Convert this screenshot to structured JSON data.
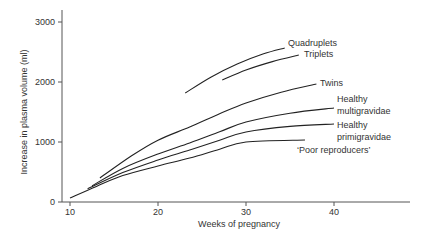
{
  "chart_data": {
    "type": "line",
    "title": "",
    "xlabel": "Weeks of pregnancy",
    "ylabel": "Increase in plasma volume (ml)",
    "xlim": [
      10,
      48.5
    ],
    "ylim": [
      0,
      3300
    ],
    "xticks": [
      10,
      20,
      30,
      40
    ],
    "yticks": [
      0,
      1000,
      2000,
      3000
    ],
    "grid": false,
    "legend": "inline labels at curve ends",
    "series": [
      {
        "name": "Quadruplets",
        "label_lines": [
          "Quadruplets"
        ],
        "points": [
          [
            23.1,
            1817
          ],
          [
            26,
            2080
          ],
          [
            29,
            2300
          ],
          [
            32,
            2470
          ],
          [
            34.4,
            2567
          ]
        ]
      },
      {
        "name": "Triplets",
        "label_lines": [
          "Triplets"
        ],
        "points": [
          [
            27.3,
            2033
          ],
          [
            30,
            2200
          ],
          [
            33,
            2340
          ],
          [
            36,
            2450
          ]
        ]
      },
      {
        "name": "Twins",
        "label_lines": [
          "Twins"
        ],
        "points": [
          [
            13.4,
            400
          ],
          [
            17,
            770
          ],
          [
            20,
            1030
          ],
          [
            23.6,
            1250
          ],
          [
            27,
            1470
          ],
          [
            30,
            1650
          ],
          [
            34,
            1830
          ],
          [
            38,
            1967
          ]
        ]
      },
      {
        "name": "Healthy multigravidae",
        "label_lines": [
          "Healthy",
          "multigravidae"
        ],
        "points": [
          [
            12.5,
            270
          ],
          [
            16,
            560
          ],
          [
            20,
            800
          ],
          [
            23.6,
            983
          ],
          [
            27,
            1170
          ],
          [
            30,
            1333
          ],
          [
            35,
            1480
          ],
          [
            40,
            1567
          ]
        ]
      },
      {
        "name": "Healthy primigravidae",
        "label_lines": [
          "Healthy",
          "primigravidae"
        ],
        "points": [
          [
            12,
            220
          ],
          [
            16,
            490
          ],
          [
            20,
            700
          ],
          [
            23.6,
            867
          ],
          [
            27,
            1030
          ],
          [
            30,
            1167
          ],
          [
            35,
            1260
          ],
          [
            40,
            1300
          ]
        ]
      },
      {
        "name": "'Poor reproducers'",
        "label_lines": [
          "‘Poor reproducers’"
        ],
        "points": [
          [
            10,
            67
          ],
          [
            13,
            260
          ],
          [
            16,
            440
          ],
          [
            20,
            600
          ],
          [
            23.6,
            733
          ],
          [
            27,
            880
          ],
          [
            30,
            1000
          ],
          [
            36.7,
            1033
          ]
        ]
      }
    ]
  }
}
